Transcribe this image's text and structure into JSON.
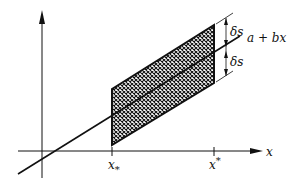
{
  "diagram": {
    "type": "confidence-band-sketch",
    "colors": {
      "ink": "#111111",
      "background": "#ffffff"
    },
    "labels": {
      "x_axis": "x",
      "line": "a + bx",
      "delta_upper": "δs",
      "delta_lower": "δs",
      "x_lower_base": "x",
      "x_lower_sub": "*",
      "x_upper_base": "x",
      "x_upper_sup": "*"
    },
    "geometry": {
      "x_axis_y": 151,
      "y_axis_x": 42,
      "band_left_x": 112,
      "band_right_x": 214,
      "band_half_width_px": 28
    }
  }
}
